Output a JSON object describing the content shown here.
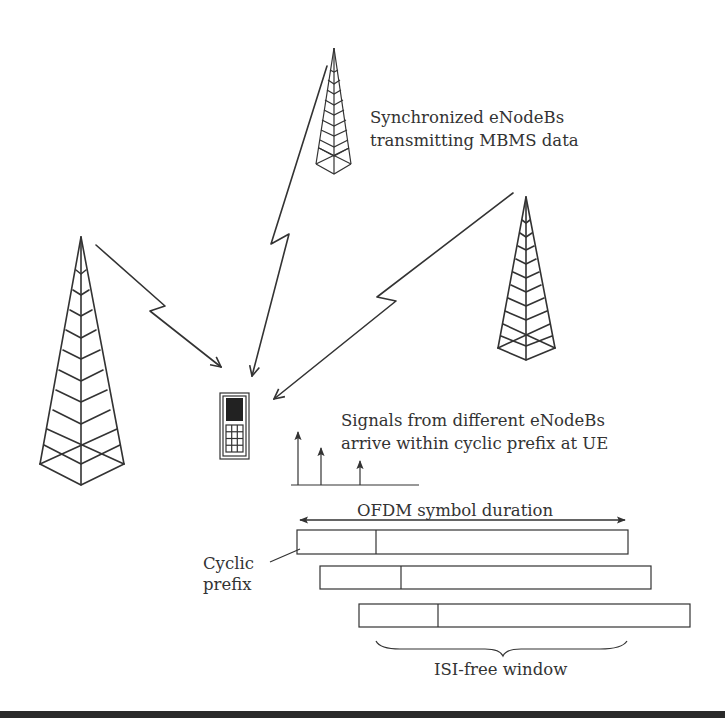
{
  "diagram": {
    "labels": {
      "enodebs_line1": "Synchronized eNodeBs",
      "enodebs_line2": "transmitting MBMS data",
      "signals_line1": "Signals from different eNodeBs",
      "signals_line2": "arrive within cyclic prefix at UE",
      "ofdm_duration": "OFDM symbol duration",
      "cyclic_prefix_line1": "Cyclic",
      "cyclic_prefix_line2": "prefix",
      "isi_window": "ISI-free window"
    },
    "nodes": [
      {
        "id": "tower-left",
        "type": "eNodeB tower",
        "size": "large"
      },
      {
        "id": "tower-top",
        "type": "eNodeB tower",
        "size": "small"
      },
      {
        "id": "tower-right",
        "type": "eNodeB tower",
        "size": "medium"
      },
      {
        "id": "ue",
        "type": "mobile phone (UE)"
      }
    ],
    "edges": [
      {
        "from": "tower-left",
        "to": "ue",
        "style": "lightning-arrow"
      },
      {
        "from": "tower-top",
        "to": "ue",
        "style": "lightning-arrow"
      },
      {
        "from": "tower-right",
        "to": "ue",
        "style": "lightning-arrow"
      }
    ],
    "impulses": [
      {
        "label": "path 1",
        "relative_height": 1.0
      },
      {
        "label": "path 2",
        "relative_height": 0.6
      },
      {
        "label": "path 3",
        "relative_height": 0.35
      }
    ],
    "symbols": [
      {
        "row": 1,
        "offset": 0
      },
      {
        "row": 2,
        "offset": 1
      },
      {
        "row": 3,
        "offset": 2
      }
    ],
    "colors": {
      "stroke": "#333333",
      "screen": "#222222",
      "background": "#ffffff",
      "bottom_rule": "#2a2a2a"
    }
  }
}
